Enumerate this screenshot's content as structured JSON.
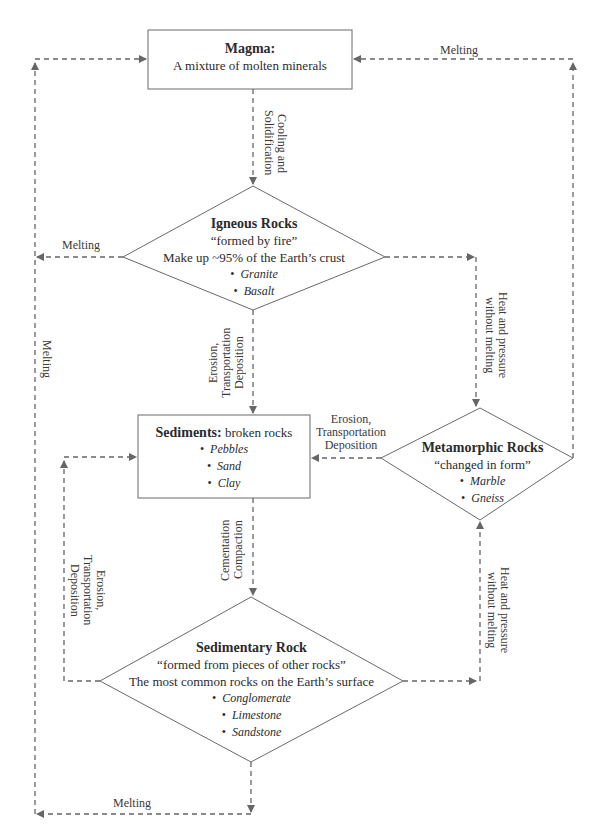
{
  "colors": {
    "line": "#666666",
    "text": "#2b2b2b",
    "background": "#ffffff"
  },
  "nodes": {
    "magma": {
      "title": "Magma:",
      "subtitle": "A mixture of molten minerals"
    },
    "igneous": {
      "title": "Igneous Rocks",
      "tagline": "“formed by fire”",
      "note": "Make up ~95% of the Earth’s crust",
      "examples": [
        "Granite",
        "Basalt"
      ]
    },
    "sediments": {
      "title": "Sediments:",
      "subtitle": "broken rocks",
      "examples": [
        "Pebbles",
        "Sand",
        "Clay"
      ]
    },
    "metamorphic": {
      "title": "Metamorphic Rocks",
      "tagline": "“changed in form”",
      "examples": [
        "Marble",
        "Gneiss"
      ]
    },
    "sedimentary": {
      "title": "Sedimentary Rock",
      "tagline": "“formed from pieces of other rocks”",
      "note": "The most common rocks on the Earth’s surface",
      "examples": [
        "Conglomerate",
        "Limestone",
        "Sandstone"
      ]
    }
  },
  "edges": {
    "metamorphic_to_magma": "Melting",
    "magma_to_igneous_1": "Cooling and",
    "magma_to_igneous_2": "Solidification",
    "igneous_melting": "Melting",
    "left_outer_melting": "Melting",
    "igneous_to_metamorphic_1": "Heat and pressure",
    "igneous_to_metamorphic_2": "without melting",
    "igneous_to_sediments_1": "Erosion,",
    "igneous_to_sediments_2": "Transportation",
    "igneous_to_sediments_3": "Deposition",
    "metamorphic_to_sediments_1": "Erosion,",
    "metamorphic_to_sediments_2": "Transportation",
    "metamorphic_to_sediments_3": "Deposition",
    "sediments_to_sedimentary_1": "Cementation",
    "sediments_to_sedimentary_2": "Compaction",
    "sedimentary_to_sediments_1": "Erosion,",
    "sedimentary_to_sediments_2": "Transportation",
    "sedimentary_to_sediments_3": "Deposition",
    "sedimentary_to_metamorphic_1": "Heat and pressure",
    "sedimentary_to_metamorphic_2": "without melting",
    "sedimentary_melting": "Melting"
  }
}
